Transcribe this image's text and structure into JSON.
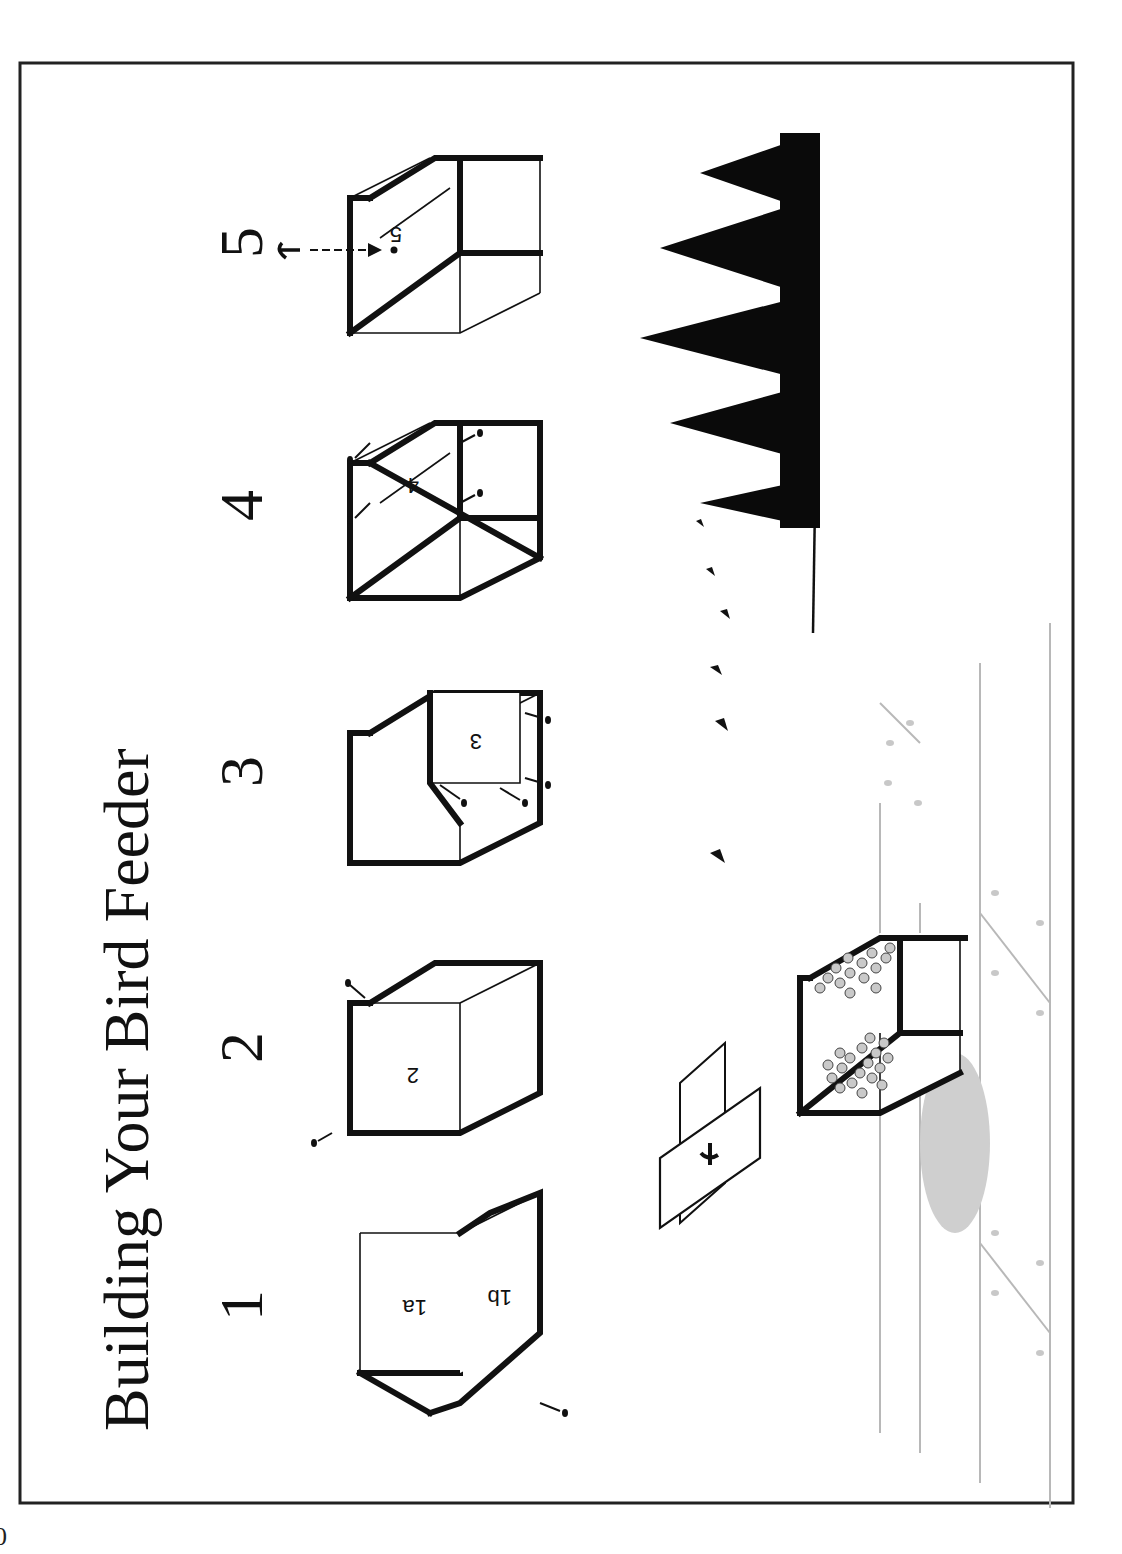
{
  "page": {
    "page_number_fragment": "0",
    "orientation": "rotated -90deg (landscape content on portrait page)"
  },
  "title": "Building Your Bird Feeder",
  "steps": [
    {
      "number": "1",
      "labels": [
        "1a",
        "1b"
      ],
      "nails": 1
    },
    {
      "number": "2",
      "labels": [
        "2"
      ],
      "nails": 2
    },
    {
      "number": "3",
      "labels": [
        "3"
      ],
      "nails": 4
    },
    {
      "number": "4",
      "labels": [
        "4"
      ],
      "nails": 4
    },
    {
      "number": "5",
      "labels": [
        "5"
      ],
      "hook_callout": true
    }
  ],
  "scene": {
    "elements": [
      "lid-with-hook",
      "filled-feeder-with-seed",
      "flying-birds",
      "pine-tree-silhouettes",
      "fence-ground-lines",
      "shadow"
    ],
    "bird_count": 6,
    "tree_count": 5
  },
  "colors": {
    "ink": "#111111",
    "seed_fill": "#c9c9c9",
    "ground_lines": "#b8b8b8",
    "shadow": "#cfcfcf",
    "frame": "#222222"
  }
}
